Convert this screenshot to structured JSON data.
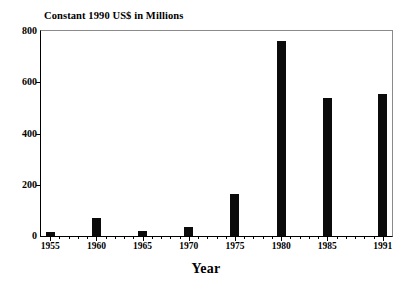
{
  "chart_data": {
    "type": "bar",
    "title": "Constant 1990 US$ in Millions",
    "xlabel": "Year",
    "ylabel": "",
    "categories": [
      "1955",
      "1960",
      "1965",
      "1970",
      "1975",
      "1980",
      "1985",
      "1991"
    ],
    "values": [
      15,
      70,
      20,
      37,
      165,
      760,
      538,
      555
    ],
    "x_numeric": [
      1955,
      1960,
      1965,
      1970,
      1975,
      1980,
      1985,
      1991
    ],
    "ylim": [
      0,
      800
    ],
    "xlim": [
      1954,
      1992
    ],
    "ytick_labels": [
      "0",
      "200",
      "400",
      "600",
      "800"
    ],
    "ytick_values": [
      0,
      200,
      400,
      600,
      800
    ],
    "xtick_labels": [
      "1955",
      "1960",
      "1965",
      "1970",
      "1975",
      "1980",
      "1985",
      "1991"
    ],
    "xtick_values": [
      1955,
      1960,
      1965,
      1970,
      1975,
      1980,
      1985,
      1991
    ],
    "x_minor_ticks": [
      1956,
      1957,
      1958,
      1959,
      1961,
      1962,
      1963,
      1964,
      1966,
      1967,
      1968,
      1969,
      1971,
      1972,
      1973,
      1974,
      1976,
      1977,
      1978,
      1979,
      1981,
      1982,
      1983,
      1984,
      1986,
      1987,
      1988,
      1989,
      1990
    ],
    "grid": false,
    "legend": null,
    "bar_color": "#0b0b0b",
    "axis_color": "#000000",
    "background_color": "#ffffff"
  }
}
